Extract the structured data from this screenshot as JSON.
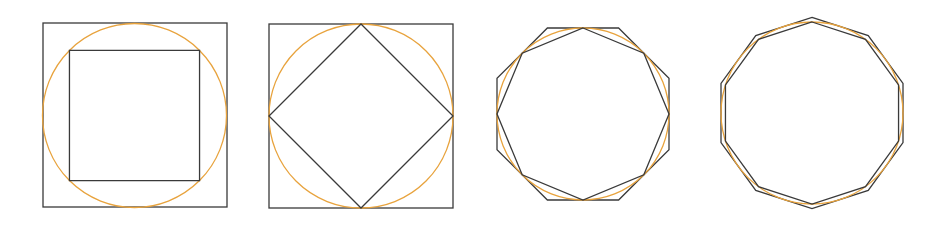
{
  "figure": {
    "background_color": "#ffffff",
    "circle_color": "#e8a33d",
    "polygon_color": "#3a3a3a",
    "square_color": "#3a3a3a",
    "stroke_width": 1.3,
    "panel_count": 4
  },
  "panels": [
    {
      "id": "panel-1",
      "label": "Circle with inscribed square and circumscribing square",
      "width": 245,
      "height": 227,
      "circle": {
        "cx": 134.5,
        "cy": 115.5,
        "r": 92,
        "color": "#e8a33d"
      },
      "outer_square": {
        "x": 43,
        "y": 23,
        "size": 184,
        "color": "#3a3a3a",
        "rotation_deg": 0
      },
      "inner_polygon": {
        "sides": 4,
        "rotation_deg": 45,
        "type": "inscribed",
        "color": "#3a3a3a"
      },
      "inscribed_sides": 4,
      "circumscribed_sides": 4
    },
    {
      "id": "panel-2",
      "label": "Circle with inscribed square and circumscribing square",
      "width": 230,
      "height": 227,
      "circle": {
        "cx": 116,
        "cy": 116,
        "r": 92,
        "color": "#e8a33d"
      },
      "outer_square": {
        "x": 24,
        "y": 24,
        "size": 184,
        "color": "#3a3a3a",
        "rotation_deg": 0
      },
      "inner_polygon": {
        "sides": 4,
        "rotation_deg": 0,
        "type": "inscribed",
        "color": "#3a3a3a"
      },
      "inscribed_sides": 4,
      "circumscribed_sides": 4
    },
    {
      "id": "panel-3",
      "label": "Circle with inscribed octagon and circumscribing octagon",
      "width": 225,
      "height": 227,
      "circle": {
        "cx": 108,
        "cy": 114,
        "r": 86,
        "color": "#e8a33d"
      },
      "inner_polygon": {
        "sides": 8,
        "rotation_deg": 0,
        "type": "inscribed",
        "color": "#3a3a3a"
      },
      "outer_polygon": {
        "sides": 8,
        "rotation_deg": 22.5,
        "type": "circumscribed",
        "color": "#3a3a3a"
      },
      "inscribed_sides": 8,
      "circumscribed_sides": 8
    },
    {
      "id": "panel-4",
      "label": "Circle with inscribed decagon and circumscribing decagon",
      "width": 235,
      "height": 227,
      "circle": {
        "cx": 112,
        "cy": 113,
        "r": 91,
        "color": "#e8a33d"
      },
      "inner_polygon": {
        "sides": 10,
        "rotation_deg": 0,
        "type": "inscribed",
        "color": "#3a3a3a"
      },
      "outer_polygon": {
        "sides": 10,
        "rotation_deg": 0,
        "type": "circumscribed",
        "color": "#3a3a3a"
      },
      "inscribed_sides": 10,
      "circumscribed_sides": 10
    }
  ]
}
